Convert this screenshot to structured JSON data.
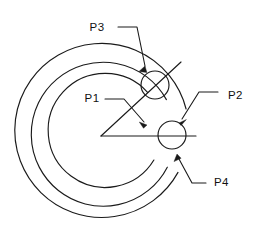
{
  "drawing": {
    "title": "Concentric arc fillet construction diagram",
    "background_color": "#ffffff",
    "line_color": "#1a1a1a",
    "labels": {
      "p1": "P1",
      "p2": "P2",
      "p3": "P3",
      "p4": "P4"
    },
    "geometry": {
      "center": {
        "x": 101,
        "y": 136
      },
      "arc_radii": [
        57,
        72,
        87
      ],
      "small_circle_radius": 14,
      "small_circles": [
        {
          "name": "upper-intersection-circle",
          "x": 155,
          "y": 85
        },
        {
          "name": "right-intersection-circle",
          "x": 172,
          "y": 135
        }
      ],
      "horizontal_radius_line": {
        "x1": 101,
        "y1": 136,
        "x2": 196,
        "y2": 136
      },
      "diagonal_radius_line": {
        "x1": 101,
        "y1": 136,
        "x2": 181,
        "y2": 62
      }
    },
    "leaders": [
      {
        "name": "p1-leader",
        "label": "P1",
        "text_x": 92,
        "text_y": 99,
        "target_x": 146,
        "target_y": 124
      },
      {
        "name": "p2-leader",
        "label": "P2",
        "text_x": 228,
        "text_y": 96,
        "target_x": 180,
        "target_y": 122
      },
      {
        "name": "p3-leader",
        "label": "P3",
        "text_x": 97,
        "text_y": 28,
        "target_x": 141,
        "target_y": 73
      },
      {
        "name": "p4-leader",
        "label": "P4",
        "text_x": 214,
        "text_y": 183,
        "target_x": 178,
        "target_y": 155
      }
    ]
  }
}
